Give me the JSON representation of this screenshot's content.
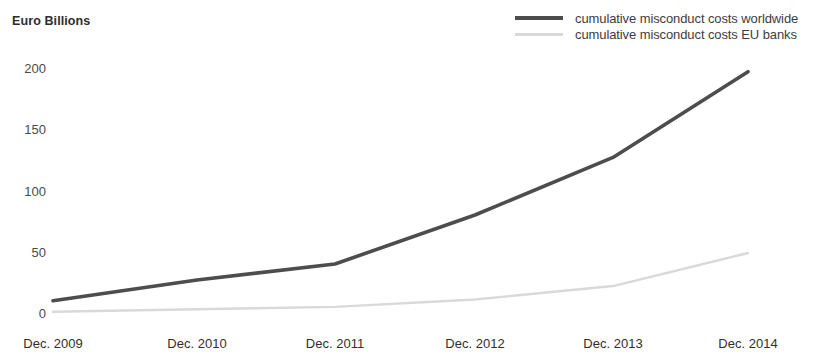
{
  "chart_data": {
    "type": "line",
    "title": "",
    "ylabel": "Euro Billions",
    "xlabel": "",
    "grid": false,
    "legend_position": "top-right",
    "ylim": [
      0,
      215
    ],
    "yticks": [
      0,
      50,
      100,
      150,
      200
    ],
    "ytick_labels": [
      "0",
      "50",
      "100",
      "150",
      "200"
    ],
    "categories": [
      "Dec. 2009",
      "Dec. 2010",
      "Dec. 2011",
      "Dec. 2012",
      "Dec. 2013",
      "Dec. 2014"
    ],
    "series": [
      {
        "name": "cumulative misconduct costs worldwide",
        "color": "#4d4d4d",
        "values": [
          10,
          27,
          40,
          80,
          127,
          197
        ]
      },
      {
        "name": "cumulative misconduct costs EU banks",
        "color": "#d9d9d9",
        "values": [
          1,
          3,
          5,
          11,
          22,
          49
        ]
      }
    ]
  },
  "legend": {
    "items": [
      {
        "label": "cumulative misconduct costs worldwide",
        "style": "dark"
      },
      {
        "label": "cumulative misconduct costs EU banks",
        "style": "light"
      }
    ]
  }
}
